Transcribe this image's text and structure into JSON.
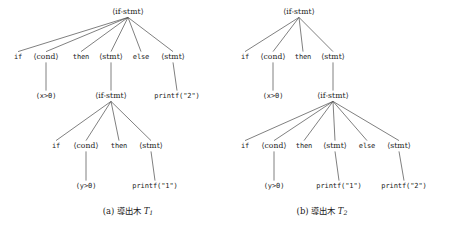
{
  "figure": {
    "width": 454,
    "height": 231,
    "background": "#ffffff",
    "ink_color": "#1a1a1a",
    "edge_color": "#555555"
  },
  "chart_data": {
    "type": "diagram",
    "subtype": "parse-tree-pair",
    "title": "",
    "trees": [
      {
        "id": "T1",
        "caption_prefix": "(a)",
        "caption_text": "導出木",
        "caption_symbol": "T",
        "caption_subscript": "1",
        "nodes": [
          {
            "id": "n0",
            "label": "⟨if-stmt⟩",
            "kind": "nonterminal",
            "x": 128,
            "y": 12,
            "level": 0
          },
          {
            "id": "n1",
            "label": "if",
            "kind": "terminal",
            "x": 18,
            "y": 57,
            "level": 1
          },
          {
            "id": "n2",
            "label": "⟨cond⟩",
            "kind": "nonterminal",
            "x": 46,
            "y": 57,
            "level": 1
          },
          {
            "id": "n3",
            "label": "then",
            "kind": "terminal",
            "x": 81,
            "y": 57,
            "level": 1
          },
          {
            "id": "n4",
            "label": "⟨stmt⟩",
            "kind": "nonterminal",
            "x": 111,
            "y": 57,
            "level": 1
          },
          {
            "id": "n5",
            "label": "else",
            "kind": "terminal",
            "x": 141,
            "y": 57,
            "level": 1
          },
          {
            "id": "n6",
            "label": "⟨stmt⟩",
            "kind": "nonterminal",
            "x": 173,
            "y": 57,
            "level": 1
          },
          {
            "id": "n7",
            "label": "(x>0)",
            "kind": "terminal",
            "x": 46,
            "y": 96,
            "level": 2
          },
          {
            "id": "n8",
            "label": "⟨if-stmt⟩",
            "kind": "nonterminal",
            "x": 111,
            "y": 96,
            "level": 2
          },
          {
            "id": "n9",
            "label": "printf(\"2\")",
            "kind": "terminal",
            "x": 177,
            "y": 96,
            "level": 2
          },
          {
            "id": "n10",
            "label": "if",
            "kind": "terminal",
            "x": 56,
            "y": 146,
            "level": 3
          },
          {
            "id": "n11",
            "label": "⟨cond⟩",
            "kind": "nonterminal",
            "x": 86,
            "y": 146,
            "level": 3
          },
          {
            "id": "n12",
            "label": "then",
            "kind": "terminal",
            "x": 119,
            "y": 146,
            "level": 3
          },
          {
            "id": "n13",
            "label": "⟨stmt⟩",
            "kind": "nonterminal",
            "x": 151,
            "y": 146,
            "level": 3
          },
          {
            "id": "n14",
            "label": "(y>0)",
            "kind": "terminal",
            "x": 86,
            "y": 186,
            "level": 4
          },
          {
            "id": "n15",
            "label": "printf(\"1\")",
            "kind": "terminal",
            "x": 155,
            "y": 186,
            "level": 4
          }
        ],
        "edges": [
          [
            "n0",
            "n1"
          ],
          [
            "n0",
            "n2"
          ],
          [
            "n0",
            "n3"
          ],
          [
            "n0",
            "n4"
          ],
          [
            "n0",
            "n5"
          ],
          [
            "n0",
            "n6"
          ],
          [
            "n2",
            "n7"
          ],
          [
            "n4",
            "n8"
          ],
          [
            "n6",
            "n9"
          ],
          [
            "n8",
            "n10"
          ],
          [
            "n8",
            "n11"
          ],
          [
            "n8",
            "n12"
          ],
          [
            "n8",
            "n13"
          ],
          [
            "n11",
            "n14"
          ],
          [
            "n13",
            "n15"
          ]
        ]
      },
      {
        "id": "T2",
        "caption_prefix": "(b)",
        "caption_text": "導出木",
        "caption_symbol": "T",
        "caption_subscript": "2",
        "nodes": [
          {
            "id": "m0",
            "label": "⟨if-stmt⟩",
            "kind": "nonterminal",
            "x": 299,
            "y": 12,
            "level": 0
          },
          {
            "id": "m1",
            "label": "if",
            "kind": "terminal",
            "x": 245,
            "y": 57,
            "level": 1
          },
          {
            "id": "m2",
            "label": "⟨cond⟩",
            "kind": "nonterminal",
            "x": 273,
            "y": 57,
            "level": 1
          },
          {
            "id": "m3",
            "label": "then",
            "kind": "terminal",
            "x": 303,
            "y": 57,
            "level": 1
          },
          {
            "id": "m4",
            "label": "⟨stmt⟩",
            "kind": "nonterminal",
            "x": 333,
            "y": 57,
            "level": 1
          },
          {
            "id": "m5",
            "label": "(x>0)",
            "kind": "terminal",
            "x": 273,
            "y": 96,
            "level": 2
          },
          {
            "id": "m6",
            "label": "⟨if-stmt⟩",
            "kind": "nonterminal",
            "x": 333,
            "y": 96,
            "level": 2
          },
          {
            "id": "m7",
            "label": "if",
            "kind": "terminal",
            "x": 245,
            "y": 146,
            "level": 3
          },
          {
            "id": "m8",
            "label": "⟨cond⟩",
            "kind": "nonterminal",
            "x": 274,
            "y": 146,
            "level": 3
          },
          {
            "id": "m9",
            "label": "then",
            "kind": "terminal",
            "x": 304,
            "y": 146,
            "level": 3
          },
          {
            "id": "m10",
            "label": "⟨stmt⟩",
            "kind": "nonterminal",
            "x": 335,
            "y": 146,
            "level": 3
          },
          {
            "id": "m11",
            "label": "else",
            "kind": "terminal",
            "x": 367,
            "y": 146,
            "level": 3
          },
          {
            "id": "m12",
            "label": "⟨stmt⟩",
            "kind": "nonterminal",
            "x": 399,
            "y": 146,
            "level": 3
          },
          {
            "id": "m13",
            "label": "(y>0)",
            "kind": "terminal",
            "x": 274,
            "y": 186,
            "level": 4
          },
          {
            "id": "m14",
            "label": "printf(\"1\")",
            "kind": "terminal",
            "x": 339,
            "y": 186,
            "level": 4
          },
          {
            "id": "m15",
            "label": "printf(\"2\")",
            "kind": "terminal",
            "x": 404,
            "y": 186,
            "level": 4
          }
        ],
        "edges": [
          [
            "m0",
            "m1"
          ],
          [
            "m0",
            "m2"
          ],
          [
            "m0",
            "m3"
          ],
          [
            "m0",
            "m4"
          ],
          [
            "m2",
            "m5"
          ],
          [
            "m4",
            "m6"
          ],
          [
            "m6",
            "m7"
          ],
          [
            "m6",
            "m8"
          ],
          [
            "m6",
            "m9"
          ],
          [
            "m6",
            "m10"
          ],
          [
            "m6",
            "m11"
          ],
          [
            "m6",
            "m12"
          ],
          [
            "m8",
            "m13"
          ],
          [
            "m10",
            "m14"
          ],
          [
            "m12",
            "m15"
          ]
        ]
      }
    ],
    "captions": [
      {
        "x": 128,
        "y": 212,
        "prefix": "(a)",
        "text": "導出木",
        "symbol": "T",
        "sub": "1"
      },
      {
        "x": 322,
        "y": 212,
        "prefix": "(b)",
        "text": "導出木",
        "symbol": "T",
        "sub": "2"
      }
    ]
  }
}
